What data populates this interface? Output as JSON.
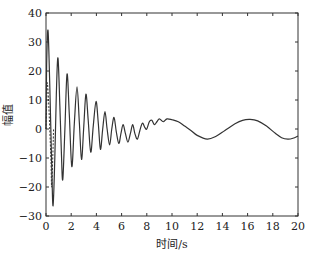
{
  "chart_data": {
    "type": "line",
    "title": "",
    "xlabel": "时间/s",
    "ylabel": "幅值",
    "xlim": [
      0,
      20
    ],
    "ylim": [
      -30,
      40
    ],
    "xticks": [
      0,
      2,
      4,
      6,
      8,
      10,
      12,
      14,
      16,
      18,
      20
    ],
    "yticks": [
      -30,
      -20,
      -10,
      0,
      10,
      20,
      30,
      40
    ],
    "grid": false,
    "legend": null,
    "series": [
      {
        "name": "solid",
        "style": "solid",
        "color": "#333333",
        "points": [
          [
            0.0,
            0
          ],
          [
            0.05,
            22
          ],
          [
            0.16,
            34
          ],
          [
            0.3,
            15
          ],
          [
            0.45,
            -12
          ],
          [
            0.56,
            -26.5
          ],
          [
            0.7,
            -10
          ],
          [
            0.82,
            12
          ],
          [
            0.95,
            24.5
          ],
          [
            1.1,
            8
          ],
          [
            1.22,
            -8
          ],
          [
            1.33,
            -17.5
          ],
          [
            1.5,
            0
          ],
          [
            1.67,
            19
          ],
          [
            1.85,
            5
          ],
          [
            2.05,
            -13
          ],
          [
            2.25,
            2
          ],
          [
            2.46,
            14.5
          ],
          [
            2.65,
            2
          ],
          [
            2.82,
            -10.5
          ],
          [
            3.0,
            1
          ],
          [
            3.17,
            12
          ],
          [
            3.35,
            3
          ],
          [
            3.55,
            -8
          ],
          [
            3.75,
            1
          ],
          [
            3.97,
            9.5
          ],
          [
            4.15,
            2
          ],
          [
            4.32,
            -7
          ],
          [
            4.5,
            0
          ],
          [
            4.68,
            6
          ],
          [
            4.85,
            0
          ],
          [
            5.05,
            -5.5
          ],
          [
            5.22,
            0
          ],
          [
            5.4,
            4
          ],
          [
            5.58,
            -1
          ],
          [
            5.78,
            -5
          ],
          [
            5.95,
            -1.5
          ],
          [
            6.12,
            1.5
          ],
          [
            6.3,
            -1.5
          ],
          [
            6.5,
            -4.5
          ],
          [
            6.7,
            -1.5
          ],
          [
            6.88,
            1.5
          ],
          [
            7.05,
            -1.5
          ],
          [
            7.25,
            -3.5
          ],
          [
            7.45,
            -0.5
          ],
          [
            7.65,
            2
          ],
          [
            7.85,
            0.5
          ],
          [
            8.0,
            0
          ],
          [
            8.2,
            2.5
          ],
          [
            8.4,
            3
          ],
          [
            8.6,
            1.5
          ],
          [
            8.8,
            2.5
          ],
          [
            9.0,
            3.5
          ],
          [
            9.3,
            2.5
          ],
          [
            9.6,
            3.5
          ],
          [
            10.0,
            3.2
          ],
          [
            10.5,
            2.5
          ],
          [
            11.0,
            1
          ],
          [
            11.5,
            -0.5
          ],
          [
            12.0,
            -2.2
          ],
          [
            12.8,
            -3.5
          ],
          [
            13.5,
            -2.5
          ],
          [
            14.2,
            -0.5
          ],
          [
            15.0,
            1.8
          ],
          [
            15.6,
            3
          ],
          [
            16.2,
            3.3
          ],
          [
            16.8,
            2.8
          ],
          [
            17.5,
            1
          ],
          [
            18.2,
            -1.5
          ],
          [
            18.7,
            -3
          ],
          [
            19.2,
            -3.5
          ],
          [
            19.6,
            -3.2
          ],
          [
            20.0,
            -2.4
          ]
        ]
      },
      {
        "name": "dashed",
        "style": "dashed",
        "color": "#333333",
        "points": [
          [
            0.0,
            0
          ],
          [
            0.05,
            8
          ],
          [
            0.1,
            16
          ],
          [
            0.2,
            10
          ],
          [
            0.3,
            0
          ],
          [
            0.4,
            -12
          ],
          [
            0.45,
            -20
          ],
          [
            0.55,
            -8
          ],
          [
            0.6,
            0
          ]
        ]
      }
    ]
  },
  "plot_area": {
    "left": 46,
    "top": 13,
    "right": 298,
    "bottom": 216
  }
}
